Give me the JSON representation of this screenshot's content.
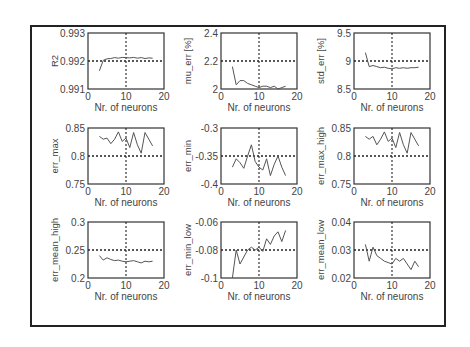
{
  "chart_data": [
    {
      "type": "line",
      "ylabel": "R2",
      "xlabel": "Nr. of neurons",
      "xlim": [
        0,
        20
      ],
      "ylim": [
        0.991,
        0.993
      ],
      "yticks": [
        "0.993",
        "0.992",
        "0.991"
      ],
      "xticks": [
        "0",
        "10",
        "20"
      ],
      "ref_y": 0.992,
      "ref_x": 10,
      "x": [
        3,
        4,
        5,
        6,
        7,
        8,
        9,
        10,
        11,
        12,
        13,
        14,
        15,
        16,
        17
      ],
      "y": [
        0.99165,
        0.99202,
        0.99208,
        0.99209,
        0.99212,
        0.9921,
        0.99213,
        0.99212,
        0.99211,
        0.99213,
        0.9921,
        0.99212,
        0.99209,
        0.99211,
        0.9921
      ]
    },
    {
      "type": "line",
      "ylabel": "mu_err [%]",
      "xlabel": "Nr. of neurons",
      "xlim": [
        0,
        20
      ],
      "ylim": [
        2.0,
        2.4
      ],
      "yticks": [
        "2.4",
        "2.2",
        "2"
      ],
      "xticks": [
        "0",
        "10",
        "20"
      ],
      "ref_y": 2.2,
      "ref_x": 10,
      "x": [
        3,
        4,
        5,
        6,
        7,
        8,
        9,
        10,
        11,
        12,
        13,
        14,
        15,
        16,
        17
      ],
      "y": [
        2.16,
        2.03,
        2.06,
        2.06,
        2.04,
        2.03,
        2.02,
        2.01,
        2.02,
        2.02,
        2.01,
        2.02,
        2.0,
        2.01,
        2.02
      ]
    },
    {
      "type": "line",
      "ylabel": "std_err [%]",
      "xlabel": "Nr. of neurons",
      "xlim": [
        0,
        20
      ],
      "ylim": [
        8.5,
        9.5
      ],
      "yticks": [
        "9.5",
        "9",
        "8.5"
      ],
      "xticks": [
        "0",
        "10",
        "20"
      ],
      "ref_y": 9.0,
      "ref_x": 10,
      "x": [
        3,
        4,
        5,
        6,
        7,
        8,
        9,
        10,
        11,
        12,
        13,
        14,
        15,
        16,
        17
      ],
      "y": [
        9.15,
        8.9,
        8.92,
        8.9,
        8.88,
        8.89,
        8.87,
        8.86,
        8.88,
        8.87,
        8.88,
        8.87,
        8.88,
        8.88,
        8.89
      ]
    },
    {
      "type": "line",
      "ylabel": "err_max",
      "xlabel": "Nr. of neurons",
      "xlim": [
        0,
        20
      ],
      "ylim": [
        0.75,
        0.85
      ],
      "yticks": [
        "0.85",
        "0.8",
        "0.75"
      ],
      "xticks": [
        "0",
        "10",
        "20"
      ],
      "ref_y": 0.8,
      "ref_x": 10,
      "x": [
        3,
        4,
        5,
        6,
        7,
        8,
        9,
        10,
        11,
        12,
        13,
        14,
        15,
        16,
        17
      ],
      "y": [
        0.835,
        0.83,
        0.832,
        0.822,
        0.83,
        0.843,
        0.826,
        0.832,
        0.815,
        0.842,
        0.82,
        0.805,
        0.842,
        0.83,
        0.818
      ]
    },
    {
      "type": "line",
      "ylabel": "err_min",
      "xlabel": "Nr. of neurons",
      "xlim": [
        0,
        20
      ],
      "ylim": [
        -0.4,
        -0.3
      ],
      "yticks": [
        "-0.3",
        "-0.35",
        "-0.4"
      ],
      "xticks": [
        "0",
        "10",
        "20"
      ],
      "ref_y": -0.35,
      "ref_x": 10,
      "x": [
        3,
        4,
        5,
        6,
        7,
        8,
        9,
        10,
        11,
        12,
        13,
        14,
        15,
        16,
        17
      ],
      "y": [
        -0.37,
        -0.355,
        -0.362,
        -0.372,
        -0.35,
        -0.33,
        -0.36,
        -0.37,
        -0.375,
        -0.355,
        -0.385,
        -0.365,
        -0.35,
        -0.37,
        -0.385
      ]
    },
    {
      "type": "line",
      "ylabel": "err_max_high",
      "xlabel": "Nr. of neurons",
      "xlim": [
        0,
        20
      ],
      "ylim": [
        0.75,
        0.85
      ],
      "yticks": [
        "0.85",
        "0.8",
        "0.75"
      ],
      "xticks": [
        "0",
        "10",
        "20"
      ],
      "ref_y": 0.8,
      "ref_x": 10,
      "x": [
        3,
        4,
        5,
        6,
        7,
        8,
        9,
        10,
        11,
        12,
        13,
        14,
        15,
        16,
        17
      ],
      "y": [
        0.835,
        0.83,
        0.835,
        0.82,
        0.83,
        0.843,
        0.826,
        0.832,
        0.815,
        0.842,
        0.82,
        0.805,
        0.842,
        0.83,
        0.818
      ]
    },
    {
      "type": "line",
      "ylabel": "err_mean_high",
      "xlabel": "Nr. of neurons",
      "xlim": [
        0,
        20
      ],
      "ylim": [
        0.2,
        0.3
      ],
      "yticks": [
        "0.3",
        "0.25",
        "0.2"
      ],
      "xticks": [
        "0",
        "10",
        "20"
      ],
      "ref_y": 0.25,
      "ref_x": 10,
      "x": [
        3,
        4,
        5,
        6,
        7,
        8,
        9,
        10,
        11,
        12,
        13,
        14,
        15,
        16,
        17
      ],
      "y": [
        0.24,
        0.232,
        0.236,
        0.233,
        0.231,
        0.232,
        0.23,
        0.229,
        0.23,
        0.231,
        0.229,
        0.227,
        0.23,
        0.229,
        0.23
      ]
    },
    {
      "type": "line",
      "ylabel": "err_min_low",
      "xlabel": "Nr. of neurons",
      "xlim": [
        0,
        20
      ],
      "ylim": [
        -0.1,
        -0.06
      ],
      "yticks": [
        "-0.06",
        "-0.08",
        "-0.1"
      ],
      "xticks": [
        "0",
        "10",
        "20"
      ],
      "ref_y": -0.08,
      "ref_x": 10,
      "x": [
        3,
        4,
        5,
        6,
        7,
        8,
        9,
        10,
        11,
        12,
        13,
        14,
        15,
        16,
        17
      ],
      "y": [
        -0.1,
        -0.08,
        -0.09,
        -0.085,
        -0.08,
        -0.078,
        -0.08,
        -0.078,
        -0.081,
        -0.072,
        -0.076,
        -0.07,
        -0.067,
        -0.074,
        -0.066
      ]
    },
    {
      "type": "line",
      "ylabel": "err_mean_low",
      "xlabel": "Nr. of neurons",
      "xlim": [
        0,
        20
      ],
      "ylim": [
        0.02,
        0.04
      ],
      "yticks": [
        "0.04",
        "0.03",
        "0.02"
      ],
      "xticks": [
        "0",
        "10",
        "20"
      ],
      "ref_y": 0.03,
      "ref_x": 10,
      "x": [
        3,
        4,
        5,
        6,
        7,
        8,
        9,
        10,
        11,
        12,
        13,
        14,
        15,
        16,
        17
      ],
      "y": [
        0.032,
        0.026,
        0.031,
        0.028,
        0.027,
        0.026,
        0.0255,
        0.025,
        0.027,
        0.026,
        0.027,
        0.025,
        0.023,
        0.026,
        0.024
      ]
    }
  ],
  "layout": {
    "cols_x": [
      88,
      221,
      354
    ],
    "rows_y": [
      33,
      128,
      222
    ],
    "axes_w": 76,
    "axes_h": 56
  }
}
